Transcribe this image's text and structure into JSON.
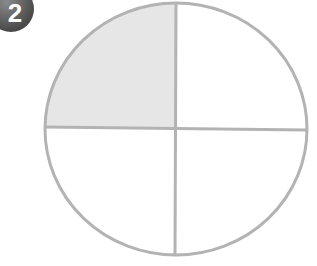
{
  "badge": {
    "number": "2"
  },
  "diagram": {
    "type": "fraction-circle",
    "parts": 4,
    "shaded_parts": 1,
    "shaded_quadrant": "top-left",
    "colors": {
      "stroke": "#b3b3b3",
      "shade": "#e6e6e6",
      "background": "#ffffff",
      "badge": "#5a5a5a"
    }
  }
}
